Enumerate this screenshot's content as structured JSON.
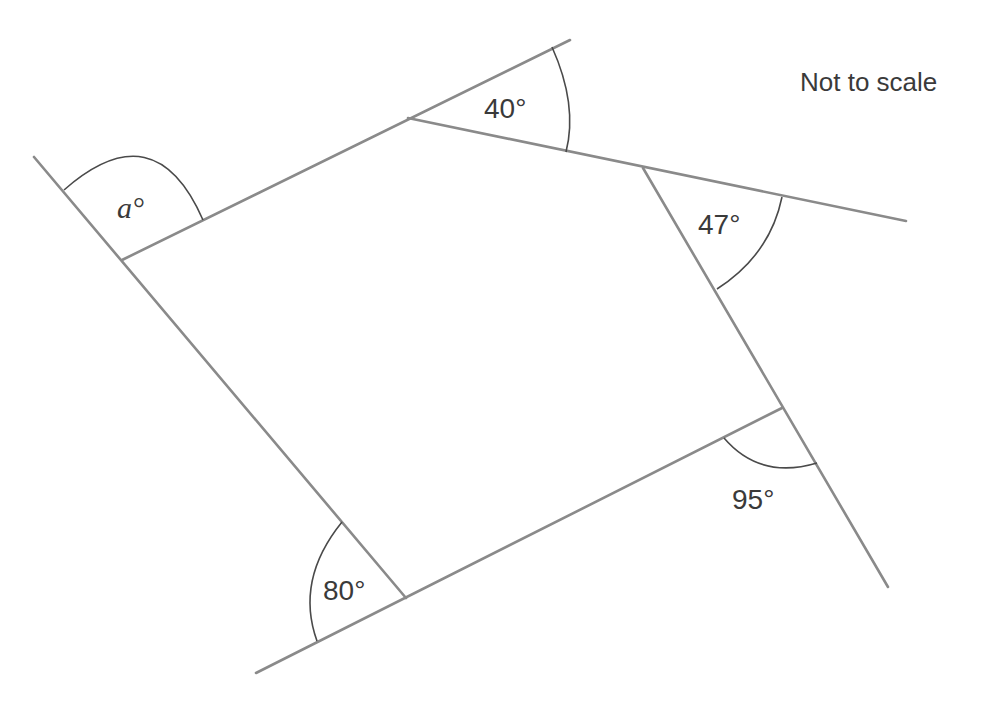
{
  "diagram": {
    "type": "pentagon-exterior-angles",
    "note": "Not to scale",
    "angles": [
      {
        "id": "a",
        "label": "a°",
        "value": null,
        "unknown": true,
        "position": "top-left exterior"
      },
      {
        "id": "b",
        "label": "40°",
        "value": 40,
        "position": "top exterior"
      },
      {
        "id": "c",
        "label": "47°",
        "value": 47,
        "position": "top-right exterior"
      },
      {
        "id": "d",
        "label": "95°",
        "value": 95,
        "position": "bottom-right exterior"
      },
      {
        "id": "e",
        "label": "80°",
        "value": 80,
        "position": "bottom-left exterior"
      }
    ],
    "colors": {
      "line": "#8a8a8a",
      "arc": "#4a4a4a",
      "text": "#3a3a3a",
      "background": "#ffffff"
    }
  }
}
